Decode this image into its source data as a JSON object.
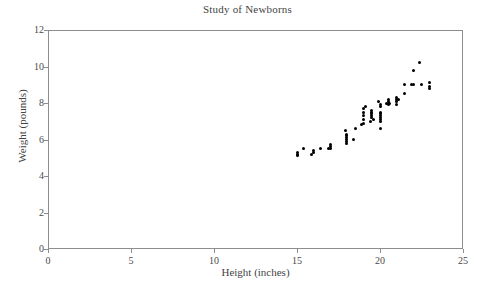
{
  "chart_data": {
    "type": "scatter",
    "title": "Study of Newborns",
    "xlabel": "Height (inches)",
    "ylabel": "Weight (pounds)",
    "xlim": [
      0,
      25
    ],
    "ylim": [
      0,
      12
    ],
    "xticks": [
      0,
      5,
      10,
      15,
      20,
      25
    ],
    "yticks": [
      0,
      2,
      4,
      6,
      8,
      10,
      12
    ],
    "grid": false,
    "legend": null,
    "marker": {
      "shape": "circle",
      "color": "#000000",
      "size": 3
    },
    "frame_color": "#8d8d8d",
    "background": "#ffffff",
    "x": [
      15.0,
      15.0,
      15.0,
      15.4,
      15.9,
      16.0,
      16.0,
      16.4,
      16.9,
      17.0,
      17.0,
      17.0,
      17.9,
      18.0,
      18.0,
      18.0,
      18.0,
      18.0,
      18.0,
      18.4,
      18.5,
      18.9,
      19.0,
      19.0,
      19.0,
      19.0,
      19.0,
      19.1,
      19.4,
      19.5,
      19.5,
      19.5,
      19.5,
      19.5,
      19.6,
      19.9,
      20.0,
      20.0,
      20.0,
      20.0,
      20.0,
      20.0,
      20.0,
      20.0,
      20.0,
      20.4,
      20.5,
      20.5,
      20.5,
      20.5,
      20.6,
      21.0,
      21.0,
      21.0,
      21.0,
      21.1,
      21.5,
      21.5,
      21.9,
      22.0,
      22.0,
      22.4,
      22.5,
      23.0,
      23.0,
      23.0
    ],
    "y": [
      5.1,
      5.2,
      5.3,
      5.5,
      5.2,
      5.3,
      5.4,
      5.5,
      5.5,
      5.5,
      5.6,
      5.7,
      6.5,
      5.8,
      5.9,
      6.0,
      6.1,
      6.2,
      6.3,
      6.0,
      6.6,
      6.8,
      6.9,
      7.1,
      7.3,
      7.5,
      7.7,
      7.8,
      7.0,
      7.2,
      7.3,
      7.4,
      7.5,
      7.6,
      7.1,
      8.1,
      6.6,
      7.0,
      7.1,
      7.2,
      7.3,
      7.4,
      7.5,
      7.8,
      7.9,
      8.0,
      7.9,
      8.0,
      8.1,
      8.2,
      8.0,
      8.1,
      8.2,
      8.3,
      7.9,
      8.2,
      8.5,
      9.0,
      9.0,
      9.0,
      9.8,
      10.2,
      9.0,
      8.8,
      9.1,
      8.9
    ],
    "n_points": 66,
    "trend": "positive"
  },
  "axes": {
    "x_tick_labels": [
      "0",
      "5",
      "10",
      "15",
      "20",
      "25"
    ],
    "y_tick_labels": [
      "0",
      "2",
      "4",
      "6",
      "8",
      "10",
      "12"
    ]
  }
}
